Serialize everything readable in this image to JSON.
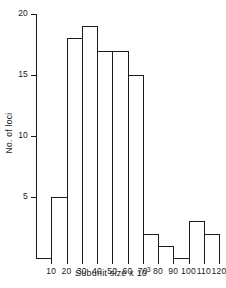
{
  "chart_data": {
    "type": "bar",
    "title": "",
    "subtitle": "",
    "xlabel_text": "Subunit size x 10",
    "xlabel_exponent": "3",
    "ylabel": "No. of loci",
    "categories": [
      "10-20",
      "20-30",
      "30-40",
      "40-50",
      "50-60",
      "60-70",
      "70-80",
      "80-90",
      "90-100",
      "100-110",
      "110-120"
    ],
    "bin_edges": [
      10,
      20,
      30,
      40,
      50,
      60,
      70,
      80,
      90,
      100,
      110,
      120
    ],
    "values": [
      5,
      18,
      19,
      17,
      17,
      15,
      2,
      1,
      0,
      3,
      2
    ],
    "series": [
      {
        "name": "No. of loci",
        "values": [
          5,
          18,
          19,
          17,
          17,
          15,
          2,
          1,
          0,
          3,
          2
        ]
      }
    ],
    "xlim": [
      0,
      120
    ],
    "ylim": [
      0,
      20
    ],
    "xticks": [
      10,
      20,
      30,
      40,
      50,
      60,
      70,
      80,
      90,
      100,
      110,
      120
    ],
    "xtick_labels": [
      "10",
      "20",
      "30",
      "40",
      "50",
      "60",
      "70",
      "80",
      "90",
      "100",
      "110",
      "120"
    ],
    "yticks": [
      5,
      10,
      15,
      20
    ],
    "ytick_labels": [
      "5",
      "10",
      "15",
      "20"
    ],
    "grid": false,
    "legend": false,
    "legend_position": "none",
    "bar_fill_color": "#ffffff",
    "bar_edge_color": "#1a1a1a",
    "axis_color": "#1a1a1a",
    "background_color": "#ffffff"
  }
}
